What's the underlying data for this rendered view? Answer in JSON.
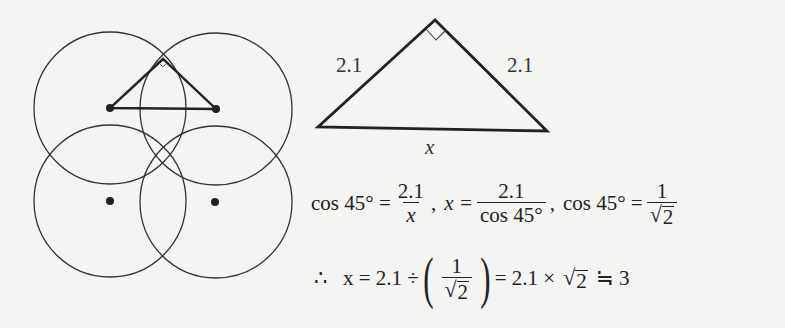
{
  "figure_left": {
    "description": "Four overlapping circles with centers marked by dots; a right triangle drawn between two upper centers and an intersection point",
    "circles": [
      {
        "cx": 110,
        "cy": 108,
        "r": 76
      },
      {
        "cx": 216,
        "cy": 109,
        "r": 76
      },
      {
        "cx": 110,
        "cy": 201,
        "r": 76
      },
      {
        "cx": 216,
        "cy": 202,
        "r": 76
      }
    ],
    "triangle": {
      "apex": [
        163,
        60
      ],
      "left": [
        110,
        108
      ],
      "right": [
        216,
        109
      ]
    }
  },
  "figure_right": {
    "triangle": {
      "apex": [
        435,
        20
      ],
      "left": [
        318,
        127
      ],
      "right": [
        547,
        131
      ]
    },
    "left_side_label": "2.1",
    "right_side_label": "2.1",
    "base_label": "x"
  },
  "equations": {
    "line1": {
      "part1_lhs": "cos 45° =",
      "part1_num": "2.1",
      "part1_den": "x",
      "sep1": ",",
      "part2_lhs": "x =",
      "part2_num": "2.1",
      "part2_den": "cos 45°",
      "sep2": ",",
      "part3_lhs": "cos 45° =",
      "part3_num": "1",
      "part3_den_radicand": "2"
    },
    "line2": {
      "therefore": "∴",
      "lhs": "x = 2.1 ÷",
      "frac_num": "1",
      "frac_den_radicand": "2",
      "mid": "= 2.1 ×",
      "radicand": "2",
      "approx": "≒ 3"
    }
  }
}
